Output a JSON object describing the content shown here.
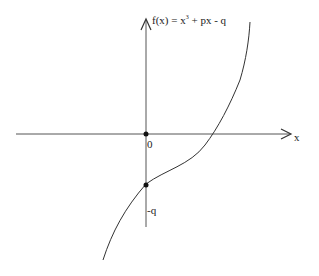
{
  "diagram": {
    "title_prefix": "f(x) = x",
    "title_exp": "3",
    "title_suffix": " + px - q",
    "x_axis_label": "x",
    "origin_label": "0",
    "intercept_label": "-q",
    "colors": {
      "axis": "#444444",
      "curve": "#333333",
      "point": "#111111"
    }
  }
}
